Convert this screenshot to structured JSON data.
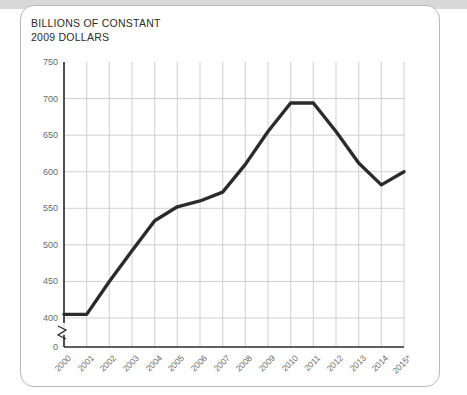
{
  "card": {
    "title": "BILLIONS OF CONSTANT\n2009 DOLLARS"
  },
  "chart_data": {
    "type": "line",
    "title": "BILLIONS OF CONSTANT 2009 DOLLARS",
    "xlabel": "",
    "ylabel": "BILLIONS OF CONSTANT 2009 DOLLARS",
    "categories": [
      "2000",
      "2001",
      "2002",
      "2003",
      "2004",
      "2005",
      "2006",
      "2007",
      "2008",
      "2009",
      "2010",
      "2011",
      "2012",
      "2013",
      "2014",
      "2015*"
    ],
    "values": [
      405,
      405,
      450,
      492,
      533,
      552,
      560,
      572,
      610,
      655,
      694,
      694,
      655,
      612,
      582,
      600
    ],
    "series": [
      {
        "name": "Constant 2009 dollars",
        "values": [
          405,
          405,
          450,
          492,
          533,
          552,
          560,
          572,
          610,
          655,
          694,
          694,
          655,
          612,
          582,
          600
        ]
      }
    ],
    "ylim": [
      400,
      750
    ],
    "yticks": [
      400,
      450,
      500,
      550,
      600,
      650,
      700,
      750
    ],
    "ytick_labels": [
      "400",
      "450",
      "500",
      "550",
      "600",
      "650",
      "700",
      "750"
    ],
    "zero_tick_label": "0",
    "axis_break": true,
    "grid": true,
    "legend": "none",
    "line_color": "#2b2b2b"
  }
}
